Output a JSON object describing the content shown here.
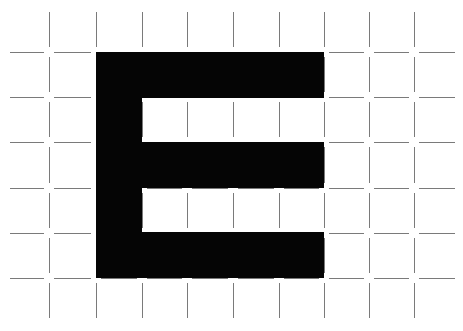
{
  "figure": {
    "letter": "E",
    "colors": {
      "background": "#ffffff",
      "letter_fill": "#050505",
      "grid_line": "#7a7a7a"
    },
    "grid": {
      "x_nodes": [
        49,
        96,
        142,
        187,
        233,
        279,
        324,
        369,
        414
      ],
      "y_nodes": [
        52,
        97,
        142,
        188,
        233,
        278
      ],
      "left_bound": 10,
      "right_bound": 455,
      "top_bound": 12,
      "bottom_bound": 318,
      "gap": 5
    },
    "letter_shape": {
      "spine": {
        "x": 96,
        "y": 52,
        "w": 46,
        "h": 226
      },
      "top_bar": {
        "x": 96,
        "y": 52,
        "w": 228,
        "h": 46
      },
      "middle_bar": {
        "x": 96,
        "y": 142,
        "w": 228,
        "h": 46
      },
      "bottom_bar": {
        "x": 96,
        "y": 232,
        "w": 228,
        "h": 46
      }
    }
  }
}
